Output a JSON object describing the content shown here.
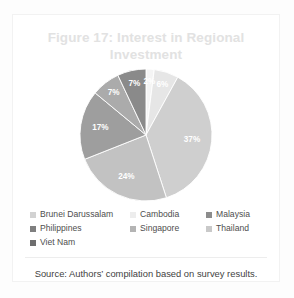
{
  "figure": {
    "title": "Figure 17: Interest in Regional Investment",
    "title_color": "#e2e2e2",
    "source_note": "Source: Authors’ compilation based on survey results."
  },
  "chart_data": {
    "type": "pie",
    "title": "Figure 17: Interest in Regional Investment",
    "xlabel": "",
    "ylabel": "",
    "legend_position": "bottom",
    "grid": false,
    "value_suffix": "%",
    "categories": [
      "Brunei Darussalam",
      "Cambodia",
      "Malaysia",
      "Philippines",
      "Singapore",
      "Thailand",
      "Viet Nam"
    ],
    "values": [
      2,
      6,
      37,
      24,
      17,
      7,
      7
    ],
    "slices": [
      {
        "label": "Brunei Darussalam",
        "value": 2,
        "display": "2%",
        "color": "#f4f4f4",
        "label_visible": true,
        "label_fill": "#bdbdbd"
      },
      {
        "label": "Cambodia",
        "value": 6,
        "display": "6%",
        "color": "#e6e6e6",
        "label_visible": true,
        "label_fill": "#ffffff"
      },
      {
        "label": "Malaysia",
        "value": 37,
        "display": "37%",
        "color": "#cfcfcf",
        "label_visible": true,
        "label_fill": "#ffffff"
      },
      {
        "label": "Philippines",
        "value": 24,
        "display": "24%",
        "color": "#c2c2c2",
        "label_visible": true,
        "label_fill": "#ffffff"
      },
      {
        "label": "Singapore",
        "value": 17,
        "display": "17%",
        "color": "#9e9e9e",
        "label_visible": true,
        "label_fill": "#ffffff"
      },
      {
        "label": "Thailand",
        "value": 7,
        "display": "7%",
        "color": "#ababab",
        "label_visible": true,
        "label_fill": "#ffffff"
      },
      {
        "label": "Viet Nam",
        "value": 7,
        "display": "7%",
        "color": "#8a8a8a",
        "label_visible": true,
        "label_fill": "#ffffff"
      }
    ]
  },
  "legend": {
    "items": [
      {
        "label": "Brunei Darussalam",
        "color": "#d2d2d2"
      },
      {
        "label": "Cambodia",
        "color": "#ededed"
      },
      {
        "label": "Malaysia",
        "color": "#8c8c8c"
      },
      {
        "label": "Philippines",
        "color": "#7f7f7f"
      },
      {
        "label": "Singapore",
        "color": "#b4b4b4"
      },
      {
        "label": "Thailand",
        "color": "#c9c9c9"
      },
      {
        "label": "Viet Nam",
        "color": "#6e6e6e"
      }
    ]
  }
}
